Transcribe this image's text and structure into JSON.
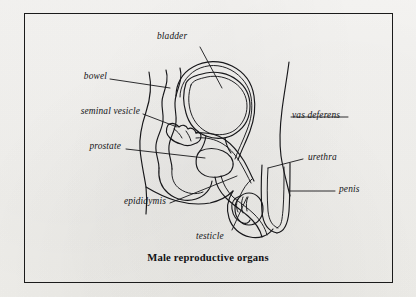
{
  "figure": {
    "caption": "Male reproductive organs",
    "border_color": "#1b1b1b",
    "ink_color": "#17171a",
    "paper_color": "#f4f3f1"
  },
  "labels": [
    {
      "id": "bladder",
      "text": "bladder",
      "side": "top"
    },
    {
      "id": "bowel",
      "text": "bowel",
      "side": "left"
    },
    {
      "id": "seminal_vesicle",
      "text": "seminal vesicle",
      "side": "left"
    },
    {
      "id": "prostate",
      "text": "prostate",
      "side": "left"
    },
    {
      "id": "epididymis",
      "text": "epididymis",
      "side": "left"
    },
    {
      "id": "testicle",
      "text": "testicle",
      "side": "bottom"
    },
    {
      "id": "vas_deferens",
      "text": "vas deferens",
      "side": "right"
    },
    {
      "id": "urethra",
      "text": "urethra",
      "side": "right"
    },
    {
      "id": "penis",
      "text": "penis",
      "side": "right"
    }
  ]
}
